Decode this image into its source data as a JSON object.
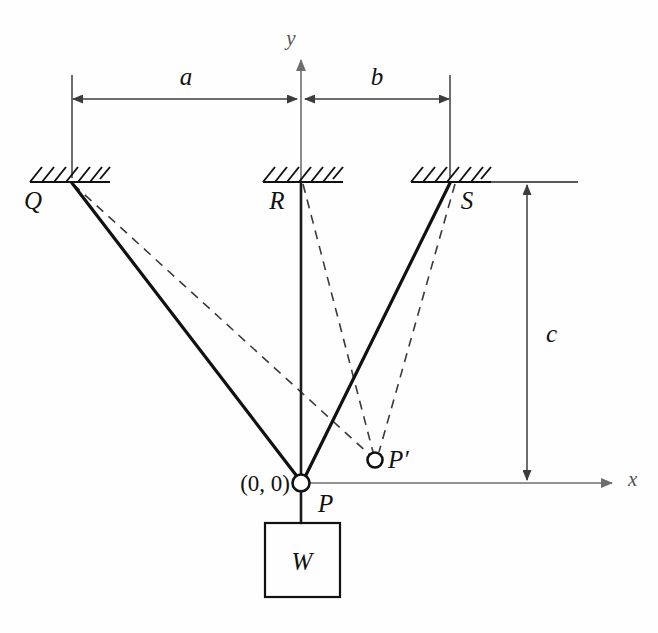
{
  "figure": {
    "kind": "statics-free-body-diagram",
    "background_color": "#fefefe",
    "line_color": "#111111",
    "dashed_color": "#3a3a3a",
    "axis_color": "#6e6e6e"
  },
  "axes": {
    "y_label": "y",
    "x_label": "x",
    "origin_label": "(0, 0)"
  },
  "dimensions": [
    {
      "id": "a",
      "label": "a",
      "orientation": "horizontal",
      "from": "Q",
      "to": "R"
    },
    {
      "id": "b",
      "label": "b",
      "orientation": "horizontal",
      "from": "R",
      "to": "S"
    },
    {
      "id": "c",
      "label": "c",
      "orientation": "vertical",
      "from": "ceiling",
      "to": "x-axis"
    }
  ],
  "supports": [
    {
      "id": "Q",
      "label": "Q",
      "x": 72,
      "y": 182
    },
    {
      "id": "R",
      "label": "R",
      "x": 301,
      "y": 182
    },
    {
      "id": "S",
      "label": "S",
      "x": 450,
      "y": 182
    }
  ],
  "nodes": [
    {
      "id": "P",
      "label": "P",
      "x": 301,
      "y": 483,
      "note": "pin joint at origin, undeformed"
    },
    {
      "id": "Pprime",
      "label": "P′",
      "x": 375,
      "y": 460,
      "note": "displaced pin position"
    }
  ],
  "members_solid": [
    {
      "from": "Q",
      "to": "P"
    },
    {
      "from": "R",
      "to": "P"
    },
    {
      "from": "S",
      "to": "P"
    }
  ],
  "members_dashed": [
    {
      "from": "Q",
      "to": "Pprime"
    },
    {
      "from": "R",
      "to": "Pprime"
    },
    {
      "from": "S",
      "to": "Pprime"
    }
  ],
  "weight": {
    "label": "W",
    "box": {
      "x": 265,
      "y": 523,
      "width": 75,
      "height": 74
    },
    "hanger_from": "P"
  }
}
